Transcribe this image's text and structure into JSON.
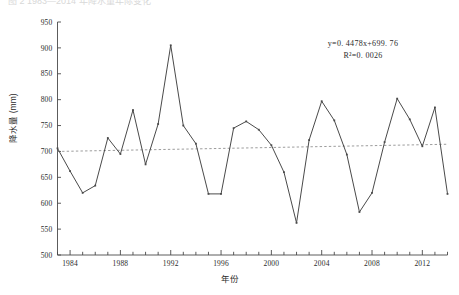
{
  "figure": {
    "cropped_header_text": "图 2  1983—2014 年降水量年际变化",
    "axis_color": "#4a4a4a",
    "series_color": "#4a4a4a",
    "trend_color": "#8a8a8a",
    "background": "#ffffff"
  },
  "annotation": {
    "equation": "y=0. 4478x+699. 76",
    "r_squared": "R²=0. 0026",
    "equation_y_symbol": "y",
    "equation_r_symbol": "R"
  },
  "chart_data": {
    "type": "line",
    "title": "",
    "xlabel": "年份",
    "ylabel": "降水量 (mm)",
    "ylim": [
      500,
      950
    ],
    "ytick_step": 50,
    "yticks": [
      500,
      550,
      600,
      650,
      700,
      750,
      800,
      850,
      900,
      950
    ],
    "ytick_labels": [
      "500",
      "550",
      "600",
      "650",
      "700",
      "750",
      "800",
      "850",
      "900",
      "950"
    ],
    "xlim": [
      1983,
      2014
    ],
    "xticks": [
      1984,
      1988,
      1992,
      1996,
      2000,
      2004,
      2008,
      2012
    ],
    "xtick_labels": [
      "1984",
      "1988",
      "1992",
      "1996",
      "2000",
      "2004",
      "2008",
      "2012"
    ],
    "minor_xtick_step": 1,
    "grid": false,
    "legend": "none",
    "x": [
      1983,
      1984,
      1985,
      1986,
      1987,
      1988,
      1989,
      1990,
      1991,
      1992,
      1993,
      1994,
      1995,
      1996,
      1997,
      1998,
      1999,
      2000,
      2001,
      2002,
      2003,
      2004,
      2005,
      2006,
      2007,
      2008,
      2009,
      2010,
      2011,
      2012,
      2013,
      2014
    ],
    "series": [
      {
        "name": "降水量",
        "type": "line",
        "values": [
          706,
          662,
          620,
          634,
          726,
          695,
          780,
          675,
          753,
          905,
          750,
          715,
          618,
          618,
          745,
          758,
          742,
          712,
          660,
          562,
          722,
          797,
          760,
          694,
          583,
          620,
          718,
          802,
          762,
          710,
          785,
          618
        ]
      },
      {
        "name": "线性趋势线",
        "type": "trend",
        "style": "dashed",
        "slope": 0.4478,
        "intercept": 699.76,
        "endpoints": [
          700.0,
          713.9
        ]
      }
    ]
  }
}
